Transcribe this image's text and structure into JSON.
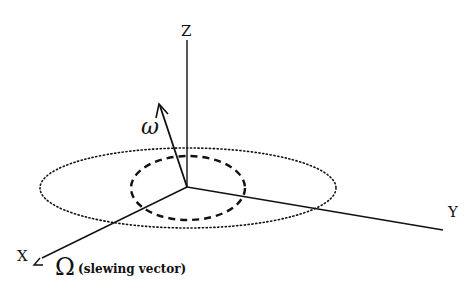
{
  "diagram": {
    "axes": {
      "x_label": "X",
      "y_label": "Y",
      "z_label": "Z"
    },
    "angular_velocity_label": "ω",
    "slewing_symbol": "Ω",
    "slewing_note": "(slewing vector)",
    "elements": [
      {
        "type": "axis",
        "name": "Z",
        "from": [
          187,
          187
        ],
        "to": [
          187,
          40
        ]
      },
      {
        "type": "axis",
        "name": "Y",
        "from": [
          187,
          187
        ],
        "to": [
          443,
          230
        ]
      },
      {
        "type": "axis",
        "name": "X",
        "from": [
          187,
          187
        ],
        "to": [
          42,
          258
        ]
      },
      {
        "type": "vector",
        "name": "omega",
        "from": [
          187,
          187
        ],
        "to": [
          160,
          108
        ],
        "style": "solid-arrow"
      },
      {
        "type": "ellipse",
        "name": "outer-orbit",
        "center": [
          188,
          188
        ],
        "rx": 148,
        "ry": 40,
        "style": "dotted"
      },
      {
        "type": "ellipse",
        "name": "inner-cone",
        "center": [
          188,
          188
        ],
        "rx": 57,
        "ry": 32,
        "style": "dashed"
      }
    ],
    "colors": {
      "ink": "#111111",
      "background": "#ffffff"
    }
  }
}
